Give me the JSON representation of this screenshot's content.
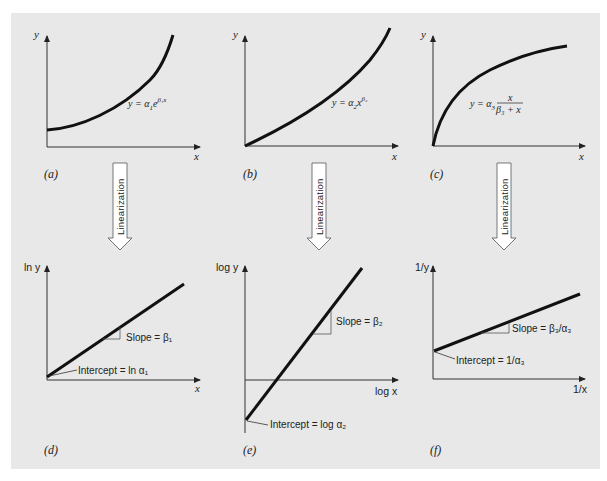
{
  "figure": {
    "background": "#e8e8e8",
    "ink": "#111111",
    "arrow_label": "Linearization",
    "panels": {
      "a": {
        "label": "(a)",
        "y_axis": "y",
        "x_axis": "x",
        "equation": "y = α₁e^(β₁x)",
        "eq_main": "y = α",
        "eq_sub": "1",
        "eq_e": "e",
        "eq_sup": "β₁x",
        "curve": "exponential"
      },
      "b": {
        "label": "(b)",
        "y_axis": "y",
        "x_axis": "x",
        "equation": "y = α₂x^β₂",
        "eq_main": "y = α",
        "eq_sub": "2",
        "eq_x": "x",
        "eq_sup": "β₂",
        "curve": "power"
      },
      "c": {
        "label": "(c)",
        "y_axis": "y",
        "x_axis": "x",
        "equation": "y = α₃ x/(β₃ + x)",
        "eq_main": "y = α",
        "eq_sub": "3",
        "eq_num": "x",
        "eq_den": "β₃ + x",
        "curve": "saturation-growth-rate"
      },
      "d": {
        "label": "(d)",
        "y_axis": "ln y",
        "x_axis": "x",
        "slope": "Slope = β₁",
        "intercept": "Intercept = ln α₁"
      },
      "e": {
        "label": "(e)",
        "y_axis": "log y",
        "x_axis": "log x",
        "slope": "Slope = β₂",
        "intercept": "Intercept = log α₂"
      },
      "f": {
        "label": "(f)",
        "y_axis": "1/y",
        "x_axis": "1/x",
        "slope": "Slope = β₃/α₃",
        "intercept": "Intercept = 1/α₃"
      }
    }
  }
}
